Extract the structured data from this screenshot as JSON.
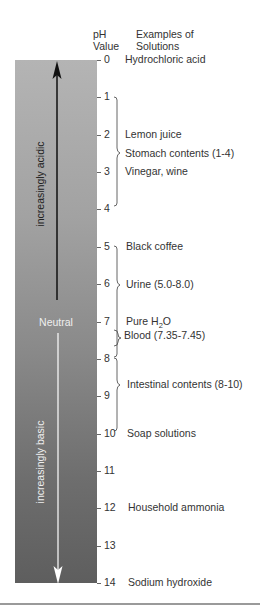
{
  "header": {
    "ph_col_line1": "pH",
    "ph_col_line2": "Value",
    "examples_col_line1": "Examples of",
    "examples_col_line2": "Solutions"
  },
  "bar": {
    "acidic_label": "increasingly acidic",
    "neutral_label": "Neutral",
    "basic_label": "increasingly basic",
    "colors": {
      "top": "#b4b4b4",
      "bottom": "#5e5e5e",
      "acid_arrow": "#111111",
      "base_arrow": "#ffffff"
    }
  },
  "scale": {
    "ticks": [
      "0",
      "1",
      "2",
      "3",
      "4",
      "5",
      "6",
      "7",
      "8",
      "9",
      "10",
      "11",
      "12",
      "13",
      "14"
    ]
  },
  "examples": [
    {
      "label": "Hydrochloric acid",
      "ph": "0"
    },
    {
      "label": "Lemon juice",
      "ph": "2"
    },
    {
      "label": "Stomach contents (1-4)",
      "range": "1-4"
    },
    {
      "label": "Vinegar, wine",
      "ph": "3"
    },
    {
      "label": "Black coffee",
      "ph": "5"
    },
    {
      "label": "Urine (5.0-8.0)",
      "range": "5.0-8.0"
    },
    {
      "label": "Pure H",
      "sub": "2",
      "suffix": "O",
      "ph": "7"
    },
    {
      "label": "Blood (7.35-7.45)",
      "range": "7.35-7.45"
    },
    {
      "label": "Intestinal contents (8-10)",
      "range": "8-10"
    },
    {
      "label": "Soap solutions",
      "ph": "10"
    },
    {
      "label": "Household ammonia",
      "ph": "12"
    },
    {
      "label": "Sodium hydroxide",
      "ph": "14"
    }
  ]
}
